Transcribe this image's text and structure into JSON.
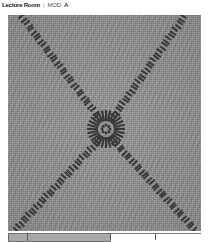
{
  "header": {
    "title_main": "Lecture Room",
    "separator": "|",
    "title_sub": "MOD",
    "title_suffix": "A"
  },
  "viewer": {
    "name": "grayscale-pattern-image",
    "background_color": "#8d8d8d",
    "mark_color": "#3a3a3a",
    "description": "Noisy gray field with an X of dark dashes converging on a central radial rosette"
  },
  "scalebar": {
    "name": "horizontal-scale-bar",
    "segments": [
      {
        "label": "",
        "start_pct": 0,
        "width_pct": 10,
        "filled": true
      },
      {
        "label": "",
        "start_pct": 10,
        "width_pct": 43,
        "filled": true
      },
      {
        "label": "",
        "start_pct": 53,
        "width_pct": 23,
        "filled": false
      },
      {
        "label": "",
        "start_pct": 76,
        "width_pct": 24,
        "filled": false
      }
    ],
    "ticks_pct": [
      10,
      53,
      76
    ]
  },
  "chart_data": {
    "type": "scatter",
    "title": "Lecture Room | MOD A",
    "xlabel": "",
    "ylabel": "",
    "xlim": [
      0,
      193
    ],
    "ylim": [
      0,
      216
    ],
    "grid": false,
    "legend": null,
    "background": "#8d8d8d",
    "series": [
      {
        "name": "diagonal-ray-upper-left",
        "description": "dash chain from top-left corner to center",
        "start": [
          14,
          2
        ],
        "end": [
          92,
          104
        ],
        "dash_count": 34,
        "dash_angle_deg": 67,
        "color": "#3a3a3a"
      },
      {
        "name": "diagonal-ray-upper-right",
        "description": "dash chain from top-right corner to center",
        "start": [
          176,
          2
        ],
        "end": [
          104,
          104
        ],
        "dash_count": 34,
        "dash_angle_deg": 113,
        "color": "#3a3a3a"
      },
      {
        "name": "diagonal-ray-lower-left",
        "description": "dash chain from center to bottom-left corner",
        "start": [
          92,
          124
        ],
        "end": [
          8,
          214
        ],
        "dash_count": 34,
        "dash_angle_deg": 113,
        "color": "#3a3a3a"
      },
      {
        "name": "diagonal-ray-lower-right",
        "description": "dash chain from center to bottom-right corner",
        "start": [
          104,
          124
        ],
        "end": [
          186,
          214
        ],
        "dash_count": 34,
        "dash_angle_deg": 67,
        "color": "#3a3a3a"
      },
      {
        "name": "central-rosette",
        "description": "radial sunburst of dashes around the convergence point",
        "center": [
          98,
          114
        ],
        "outer_radius": 19,
        "inner_radius": 8,
        "spoke_count": 28,
        "color": "#3a3a3a"
      },
      {
        "name": "inner-core-ring",
        "description": "small ring of dots at the very center",
        "center": [
          98,
          114
        ],
        "radius": 4,
        "dot_count": 8,
        "color": "#3a3a3a"
      }
    ]
  }
}
